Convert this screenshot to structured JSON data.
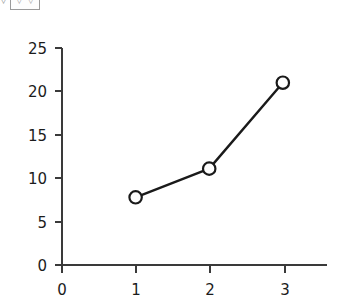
{
  "toolbar": {
    "stray_glyph": "▿",
    "box_glyphs": [
      "▿",
      "▿"
    ]
  },
  "chart_data": {
    "type": "line",
    "title": "",
    "subtitle": "",
    "xlabel": "",
    "ylabel": "",
    "x": [
      1,
      2,
      3
    ],
    "values": [
      7.8,
      11.1,
      21.0
    ],
    "series": [
      {
        "name": "",
        "values": [
          7.8,
          11.1,
          21.0
        ]
      }
    ],
    "xlim": [
      0,
      3.6
    ],
    "ylim": [
      0,
      25
    ],
    "xticks": [
      0,
      1,
      2,
      3
    ],
    "yticks": [
      0,
      5,
      10,
      15,
      20,
      25
    ],
    "xtick_labels": [
      "0",
      "1",
      "2",
      "3"
    ],
    "ytick_labels": [
      "0",
      "5",
      "10",
      "15",
      "20",
      "25"
    ],
    "grid": false,
    "legend": false,
    "legend_position": "none",
    "marker": "open-circle",
    "line_color": "#1a1a1a",
    "marker_face_color": "#ffffff",
    "marker_edge_color": "#1a1a1a",
    "background_color": "#ffffff",
    "axis_color": "#3a3a3a",
    "annotations": []
  }
}
